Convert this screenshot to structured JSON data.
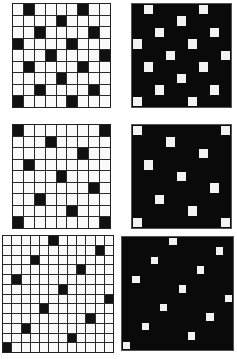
{
  "diagram": {
    "title": "",
    "panels": [
      {
        "id": "top-left",
        "rows": 9,
        "cols": 9,
        "style": "light",
        "x": 12,
        "y": 3,
        "w": 99,
        "h": 105,
        "marked": [
          [
            0,
            1
          ],
          [
            0,
            6
          ],
          [
            1,
            4
          ],
          [
            2,
            2
          ],
          [
            2,
            7
          ],
          [
            3,
            0
          ],
          [
            3,
            5
          ],
          [
            4,
            3
          ],
          [
            4,
            8
          ],
          [
            5,
            1
          ],
          [
            5,
            6
          ],
          [
            6,
            4
          ],
          [
            7,
            2
          ],
          [
            7,
            7
          ],
          [
            8,
            0
          ],
          [
            8,
            5
          ]
        ]
      },
      {
        "id": "top-right",
        "rows": 9,
        "cols": 9,
        "style": "dark",
        "x": 131,
        "y": 3,
        "w": 101,
        "h": 105,
        "marked": [
          [
            0,
            1
          ],
          [
            0,
            6
          ],
          [
            1,
            4
          ],
          [
            2,
            2
          ],
          [
            2,
            7
          ],
          [
            3,
            0
          ],
          [
            3,
            5
          ],
          [
            4,
            3
          ],
          [
            4,
            8
          ],
          [
            5,
            1
          ],
          [
            5,
            6
          ],
          [
            6,
            4
          ],
          [
            7,
            2
          ],
          [
            7,
            7
          ],
          [
            8,
            0
          ],
          [
            8,
            5
          ]
        ]
      },
      {
        "id": "middle-left",
        "rows": 9,
        "cols": 9,
        "style": "light",
        "x": 12,
        "y": 124,
        "w": 99,
        "h": 105,
        "marked": [
          [
            0,
            0
          ],
          [
            0,
            8
          ],
          [
            1,
            3
          ],
          [
            2,
            6
          ],
          [
            3,
            1
          ],
          [
            4,
            4
          ],
          [
            5,
            7
          ],
          [
            6,
            2
          ],
          [
            7,
            5
          ],
          [
            8,
            0
          ],
          [
            8,
            8
          ]
        ]
      },
      {
        "id": "middle-right",
        "rows": 9,
        "cols": 9,
        "style": "dark",
        "x": 131,
        "y": 124,
        "w": 101,
        "h": 105,
        "marked": [
          [
            0,
            0
          ],
          [
            0,
            8
          ],
          [
            1,
            3
          ],
          [
            2,
            6
          ],
          [
            3,
            1
          ],
          [
            4,
            4
          ],
          [
            5,
            7
          ],
          [
            6,
            2
          ],
          [
            7,
            5
          ],
          [
            8,
            0
          ],
          [
            8,
            8
          ]
        ]
      },
      {
        "id": "bottom-left",
        "rows": 12,
        "cols": 12,
        "style": "light",
        "x": 2,
        "y": 235,
        "w": 112,
        "h": 118,
        "marked": [
          [
            0,
            5
          ],
          [
            1,
            10
          ],
          [
            2,
            3
          ],
          [
            3,
            8
          ],
          [
            4,
            1
          ],
          [
            5,
            6
          ],
          [
            6,
            11
          ],
          [
            7,
            4
          ],
          [
            8,
            9
          ],
          [
            9,
            2
          ],
          [
            10,
            7
          ],
          [
            11,
            0
          ]
        ]
      },
      {
        "id": "bottom-right",
        "rows": 12,
        "cols": 12,
        "style": "dark",
        "x": 121,
        "y": 236,
        "w": 113,
        "h": 115,
        "marked": [
          [
            0,
            5
          ],
          [
            1,
            10
          ],
          [
            2,
            3
          ],
          [
            3,
            8
          ],
          [
            4,
            1
          ],
          [
            5,
            6
          ],
          [
            6,
            11
          ],
          [
            7,
            4
          ],
          [
            8,
            9
          ],
          [
            9,
            2
          ],
          [
            10,
            7
          ],
          [
            11,
            0
          ]
        ]
      }
    ],
    "colors": {
      "cell_light": "#fafafa",
      "cell_dark": "#0a0a0a",
      "mark_on_light": "#111111",
      "mark_on_dark": "#f2f2f2"
    }
  }
}
